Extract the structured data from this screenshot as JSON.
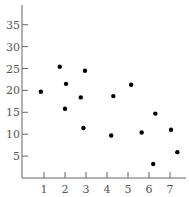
{
  "chart_data": {
    "type": "scatter",
    "title": "",
    "xlabel": "",
    "ylabel": "",
    "xlim": [
      0,
      7.6
    ],
    "ylim": [
      0,
      38
    ],
    "x_ticks": [
      1,
      2,
      3,
      4,
      5,
      6,
      7
    ],
    "y_ticks": [
      5,
      10,
      15,
      20,
      25,
      30,
      35
    ],
    "grid": false,
    "legend": null,
    "series": [
      {
        "name": "points",
        "color": "#000000",
        "points": [
          {
            "x": 0.85,
            "y": 19.7
          },
          {
            "x": 1.75,
            "y": 25.4
          },
          {
            "x": 2.05,
            "y": 21.5
          },
          {
            "x": 2.0,
            "y": 15.8
          },
          {
            "x": 2.75,
            "y": 18.4
          },
          {
            "x": 2.95,
            "y": 24.5
          },
          {
            "x": 2.88,
            "y": 11.4
          },
          {
            "x": 4.2,
            "y": 9.7
          },
          {
            "x": 4.3,
            "y": 18.7
          },
          {
            "x": 5.15,
            "y": 21.3
          },
          {
            "x": 5.65,
            "y": 10.4
          },
          {
            "x": 6.2,
            "y": 3.2
          },
          {
            "x": 6.3,
            "y": 14.7
          },
          {
            "x": 7.05,
            "y": 11.0
          },
          {
            "x": 7.35,
            "y": 5.9
          }
        ]
      }
    ]
  },
  "style": {
    "axis_color": "#666666",
    "label_color": "#555555",
    "point_color": "#000000"
  }
}
